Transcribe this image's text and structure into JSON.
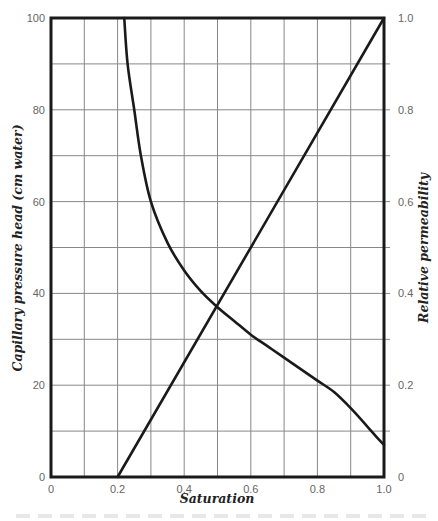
{
  "chart_data": {
    "type": "line",
    "title": "",
    "xlabel": "Saturation",
    "ylabel": "Capillary pressure head (cm water)",
    "y2label": "Relative permeability",
    "xlim": [
      0,
      1.0
    ],
    "ylim": [
      0,
      100
    ],
    "y2lim": [
      0,
      1.0
    ],
    "grid": true,
    "x_ticks": [
      "0",
      "0.2",
      "0.4",
      "0.6",
      "0.8",
      "1.0"
    ],
    "y_ticks": [
      "0",
      "20",
      "40",
      "60",
      "80",
      "100"
    ],
    "y2_ticks": [
      "0",
      "0.2",
      "0.4",
      "0.6",
      "0.8",
      "1.0"
    ],
    "series": [
      {
        "name": "Capillary pressure head",
        "axis": "left",
        "x": [
          0.22,
          0.23,
          0.25,
          0.27,
          0.3,
          0.35,
          0.4,
          0.45,
          0.5,
          0.55,
          0.6,
          0.65,
          0.7,
          0.75,
          0.8,
          0.85,
          0.9,
          0.95,
          0.98,
          1.0
        ],
        "values": [
          100,
          90,
          80,
          70,
          60,
          51,
          45,
          40.5,
          37,
          34,
          31,
          28.5,
          26,
          23.5,
          21,
          18.5,
          15,
          11,
          8.5,
          7
        ]
      },
      {
        "name": "Relative permeability",
        "axis": "right",
        "x": [
          0.2,
          1.0
        ],
        "values": [
          0.0,
          1.0
        ]
      }
    ]
  },
  "labels": {
    "x_title": "Saturation",
    "y_title": "Capillary pressure head (cm water)",
    "y2_title": "Relative permeability"
  }
}
